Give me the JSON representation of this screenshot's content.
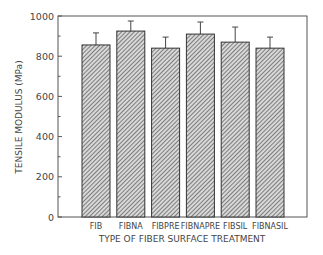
{
  "chart_data": {
    "type": "bar",
    "title": "",
    "xlabel": "TYPE OF FIBER SURFACE TREATMENT",
    "ylabel": "TENSILE MODULUS (MPa)",
    "categories": [
      "FIB",
      "FIBNA",
      "FIBPRE",
      "FIBNAPRE",
      "FIBSIL",
      "FIBNASIL"
    ],
    "values": [
      856,
      925,
      840,
      910,
      870,
      840
    ],
    "error_upper": [
      60,
      50,
      55,
      60,
      75,
      55
    ],
    "ylim": [
      0,
      1000
    ],
    "yticks": [
      0,
      200,
      400,
      600,
      800,
      1000
    ],
    "grid": false,
    "legend": null,
    "bar_fill": "hatched",
    "colors": {
      "bar_stroke": "#333333",
      "hatch": "#555555",
      "axis": "#555555"
    }
  }
}
